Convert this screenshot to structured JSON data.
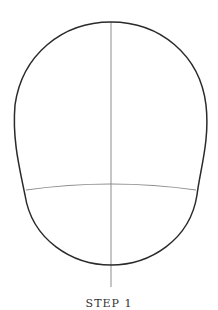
{
  "diagram": {
    "step_label": "STEP 1",
    "colors": {
      "outline": "#2a2a2a",
      "guide": "#a0a0a0",
      "background": "#ffffff"
    },
    "shapes": {
      "head_outline": "egg-shaped head oval, wide top, narrowing to a rounded chin",
      "vertical_guide": "center line from crown to below chin",
      "horizontal_guide": "curved eye/brow line across lower third"
    }
  }
}
